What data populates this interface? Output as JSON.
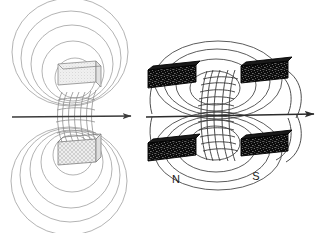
{
  "figure": {
    "background_color": "#ffffff",
    "width": 329,
    "height": 233,
    "panels": [
      {
        "id": "left-panel",
        "name": "schematic-field-view",
        "description": "Light-toned schematic of two stippled pole blocks with nested circular field loops and an hourglass flux bundle between them",
        "axis_arrow": {
          "name": "horizontal-axis-arrow",
          "x1": 12,
          "y1": 117,
          "x2": 133,
          "y2": 116,
          "color": "#3b3b3b"
        },
        "blocks": [
          {
            "name": "upper-pole-block",
            "fill": "#ededed",
            "stroke": "#8a8a8a",
            "texture": "fine-stipple"
          },
          {
            "name": "lower-pole-block",
            "fill": "#e4e4e4",
            "stroke": "#7d7d7d",
            "texture": "cross-hatch"
          }
        ],
        "field_loops_upper": 5,
        "field_loops_lower": 5,
        "flux_lines": 7,
        "line_color": "#8e8e8e"
      },
      {
        "id": "right-panel",
        "name": "pole-piece-view",
        "description": "Perspective view of dark speckled magnet pole pieces with nested elliptical field loops and a central flux bundle",
        "axis_arrow": {
          "name": "horizontal-axis-arrow",
          "x1": 146,
          "y1": 117,
          "x2": 316,
          "y2": 114,
          "color": "#2b2b2b"
        },
        "bars": [
          {
            "name": "top-left-pole-bar",
            "fill": "#0d0d0d",
            "speckle": "#ffffff"
          },
          {
            "name": "top-right-pole-bar",
            "fill": "#0d0d0d",
            "speckle": "#ffffff"
          },
          {
            "name": "bottom-left-pole-bar",
            "fill": "#0d0d0d",
            "speckle": "#ffffff"
          },
          {
            "name": "bottom-right-pole-bar",
            "fill": "#0d0d0d",
            "speckle": "#ffffff"
          }
        ],
        "field_loops_upper": 4,
        "field_loops_lower": 4,
        "flux_lines": 11,
        "line_color": "#3a3a3a",
        "labels": {
          "north_pole": "N",
          "south_pole": "S"
        }
      }
    ]
  }
}
